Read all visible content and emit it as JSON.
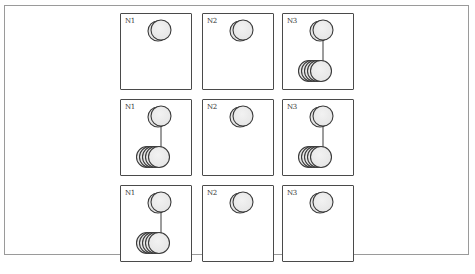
{
  "diagram": {
    "rows": [
      {
        "nodes": [
          {
            "label": "N1",
            "replicas": 1,
            "has_stack": false
          },
          {
            "label": "N2",
            "replicas": 1,
            "has_stack": false
          },
          {
            "label": "N3",
            "replicas": 1,
            "has_stack": true
          }
        ]
      },
      {
        "nodes": [
          {
            "label": "N1",
            "replicas": 1,
            "has_stack": true
          },
          {
            "label": "N2",
            "replicas": 1,
            "has_stack": false
          },
          {
            "label": "N3",
            "replicas": 1,
            "has_stack": true
          }
        ]
      },
      {
        "nodes": [
          {
            "label": "N1",
            "replicas": 1,
            "has_stack": true
          },
          {
            "label": "N2",
            "replicas": 1,
            "has_stack": false
          },
          {
            "label": "N3",
            "replicas": 1,
            "has_stack": false
          }
        ]
      }
    ],
    "colors": {
      "disk_fill": "#e6e6e6",
      "disk_stroke": "#3a3a3a",
      "box_stroke": "#4a4a4a"
    }
  }
}
